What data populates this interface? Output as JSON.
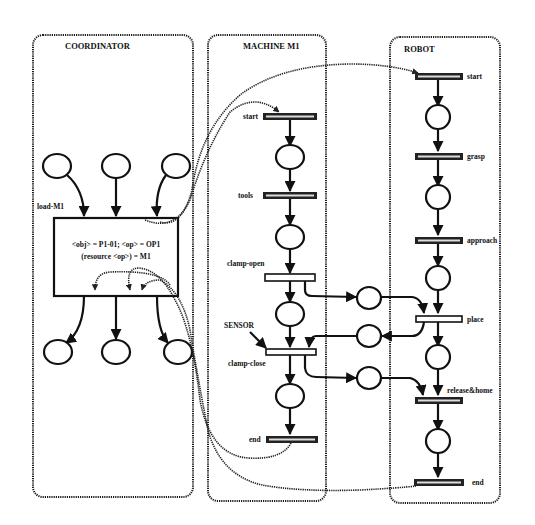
{
  "panels": {
    "coordinator": {
      "title": "COORDINATOR",
      "transition_label": "load-M1",
      "box_line1": "<obj> = P1-01; <op> = OP1",
      "box_line2": "(resource <op>) = M1"
    },
    "machine": {
      "title": "MACHINE M1",
      "transitions": [
        "start",
        "tools",
        "clamp-open",
        "clamp-close",
        "end"
      ],
      "sensor_label": "SENSOR"
    },
    "robot": {
      "title": "ROBOT",
      "transitions": [
        "start",
        "grasp",
        "approach",
        "place",
        "release&home",
        "end"
      ]
    }
  },
  "colors": {
    "line": "#111111",
    "background": "#ffffff"
  }
}
